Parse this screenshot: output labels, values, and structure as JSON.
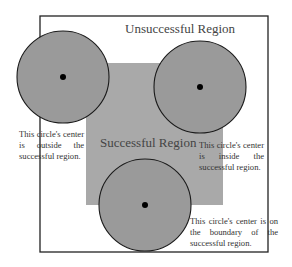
{
  "diagram": {
    "outer_region_label": "Unsuccessful Region",
    "inner_region_label": "Successful Region",
    "notes": {
      "outside": "This circle's center is outside the successful region.",
      "inside": "This circle's center is inside the successful region.",
      "boundary": "This circle's center is on the boundary of the successful region."
    },
    "colors": {
      "outer_fill": "#ffffff",
      "outer_stroke": "#222222",
      "inner_fill": "#a9a9a9",
      "circle_fill": "#9a9a9a",
      "circle_stroke": "#1a1a1a",
      "center_dot": "#000000"
    }
  }
}
